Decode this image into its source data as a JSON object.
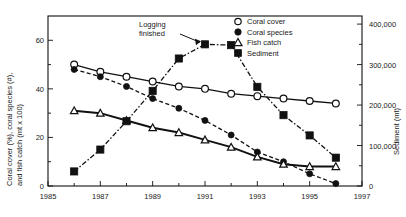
{
  "chart_data": {
    "type": "line",
    "title": "",
    "xlabel": "",
    "ylabel": "Coral cover (%), coral species (#),\nand fish catch (mt x 100)",
    "ylabel_line1": "Coral cover (%), coral species (#),",
    "ylabel_line2": "and fish catch (mt x 100)",
    "y2label": "Sediment (mt)",
    "xlim": [
      1985,
      1997
    ],
    "ylim": [
      0,
      70
    ],
    "y2lim": [
      0,
      420000
    ],
    "grid": false,
    "legend_position": "top-right",
    "x_ticks_major": [
      1985,
      1987,
      1989,
      1991,
      1993,
      1995,
      1997
    ],
    "x_tick_labels": [
      "1985",
      "1987",
      "1989",
      "1991",
      "1993",
      "1995",
      "1997"
    ],
    "x_ticks_minor": [
      1986,
      1988,
      1990,
      1992,
      1994,
      1996
    ],
    "y_ticks_major": [
      0,
      20,
      40,
      60
    ],
    "y_tick_labels": [
      "0",
      "20",
      "40",
      "60"
    ],
    "y_ticks_minor": [
      10,
      30,
      50
    ],
    "y2_ticks_major": [
      0,
      100000,
      200000,
      300000,
      400000
    ],
    "y2_tick_labels": [
      "0",
      "100,000",
      "200,000",
      "300,000",
      "400,000"
    ],
    "y2_ticks_minor": [
      50000,
      150000,
      250000,
      350000
    ],
    "x": [
      1986,
      1987,
      1988,
      1989,
      1990,
      1991,
      1992,
      1993,
      1994,
      1995,
      1996
    ],
    "series": [
      {
        "name": "Coral cover",
        "axis": "left",
        "marker": "open-circle",
        "linestyle": "solid",
        "values": [
          50,
          47,
          45,
          43,
          41,
          40,
          38,
          37,
          36,
          35,
          34
        ]
      },
      {
        "name": "Coral species",
        "axis": "left",
        "marker": "filled-circle",
        "linestyle": "dashed",
        "values": [
          48,
          45,
          41,
          36,
          32,
          27,
          21,
          14,
          10,
          5,
          1
        ]
      },
      {
        "name": "Fish catch",
        "axis": "left",
        "marker": "open-triangle",
        "linestyle": "solid",
        "values": [
          31,
          30,
          27,
          24,
          22,
          19,
          16,
          12,
          9,
          8,
          8
        ]
      },
      {
        "name": "Sediment",
        "axis": "right",
        "marker": "filled-square",
        "linestyle": "dash-dot",
        "values": [
          36000,
          90000,
          160000,
          235000,
          315000,
          350000,
          348000,
          245000,
          175000,
          125000,
          70000
        ]
      }
    ],
    "annotations": [
      {
        "text_line1": "Logging",
        "text_line2": "finished",
        "points_to_x": 1991,
        "points_to_series": "Sediment"
      }
    ],
    "legend": [
      {
        "label": "Coral cover",
        "marker": "open-circle"
      },
      {
        "label": "Coral species",
        "marker": "filled-circle"
      },
      {
        "label": "Fish catch",
        "marker": "open-triangle"
      },
      {
        "label": "Sediment",
        "marker": "filled-square"
      }
    ]
  },
  "colors": {
    "ink": "#111111",
    "background": "#ffffff"
  }
}
